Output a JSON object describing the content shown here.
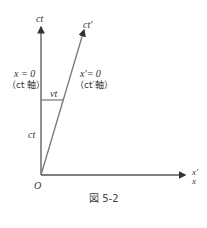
{
  "diagram": {
    "axes": {
      "vertical_label": "ct",
      "slanted_label": "ct′",
      "horizontal_label_top": "x′",
      "horizontal_label_bottom": "x",
      "origin_label": "O"
    },
    "annotations": {
      "left_eq": "x = 0",
      "left_axis": "（ct 軸）",
      "right_eq": "x′= 0",
      "right_axis": "（ct′軸）",
      "segment_label": "vt",
      "height_label": "ct"
    },
    "caption": "図 5-2",
    "colors": {
      "line": "#555555",
      "text": "#333333"
    }
  }
}
